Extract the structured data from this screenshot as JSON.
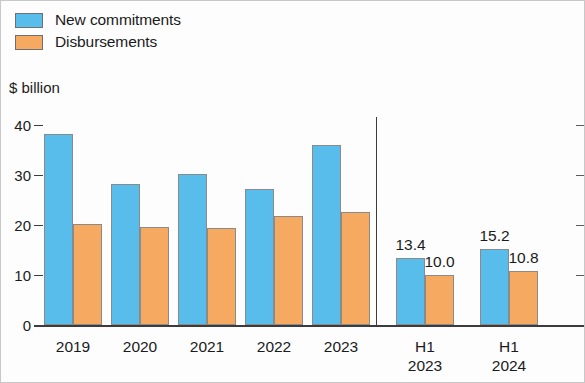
{
  "legend": {
    "items": [
      {
        "label": "New commitments",
        "color": "#58bdea",
        "icon": "legend-swatch-icon"
      },
      {
        "label": "Disbursements",
        "color": "#f6a961",
        "icon": "legend-swatch-icon"
      }
    ]
  },
  "axis_title": "$ billion",
  "chart_data": {
    "type": "bar",
    "title": "",
    "subtitle": "",
    "xlabel": "",
    "ylabel": "$ billion",
    "ylim": [
      0,
      40
    ],
    "yticks": [
      0,
      10,
      20,
      30,
      40
    ],
    "ytick_labels": [
      "0",
      "10",
      "20",
      "30",
      "40"
    ],
    "grid": false,
    "legend_position": "top-left",
    "categories": [
      "2019",
      "2020",
      "2021",
      "2022",
      "2023",
      "H1\n2023",
      "H1\n2024"
    ],
    "separator_after_category_index": 4,
    "series": [
      {
        "name": "New commitments",
        "color": "#58bdea",
        "values": [
          38.2,
          28.2,
          30.3,
          27.3,
          36.1,
          13.4,
          15.2
        ],
        "labels": [
          "",
          "",
          "",
          "",
          "",
          "13.4",
          "15.2"
        ]
      },
      {
        "name": "Disbursements",
        "color": "#f6a961",
        "values": [
          20.2,
          19.6,
          19.5,
          21.9,
          22.7,
          10.0,
          10.8
        ],
        "labels": [
          "",
          "",
          "",
          "",
          "",
          "10.0",
          "10.8"
        ]
      }
    ]
  }
}
